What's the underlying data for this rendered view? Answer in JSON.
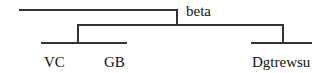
{
  "diagram": {
    "type": "tree",
    "root": {
      "label": "beta"
    },
    "leaves": [
      {
        "label": "VC"
      },
      {
        "label": "GB"
      },
      {
        "label": "Dgtrewsu"
      }
    ],
    "colors": {
      "line": "#333333",
      "text": "#111111",
      "background": "#ffffff"
    }
  }
}
